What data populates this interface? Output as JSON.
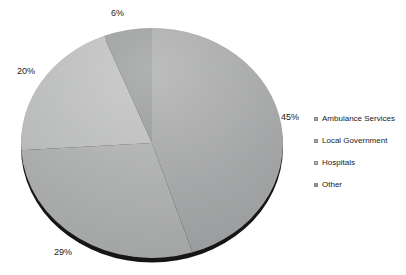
{
  "chart_data": {
    "type": "pie",
    "title": "",
    "categories": [
      "Ambulance Services",
      "Local Government",
      "Hospitals",
      "Other"
    ],
    "values": [
      45,
      29,
      20,
      6
    ],
    "slice_labels": [
      "45%",
      "29%",
      "20%",
      "6%"
    ],
    "colors": [
      "#a0a1a2",
      "#a9aaaa",
      "#b7b8b8",
      "#8f9192"
    ],
    "shadow_color": "#161616",
    "background": "#ffffff",
    "legend_position": "right",
    "label_format": "percent",
    "start_angle_deg": 0,
    "direction": "clockwise"
  }
}
